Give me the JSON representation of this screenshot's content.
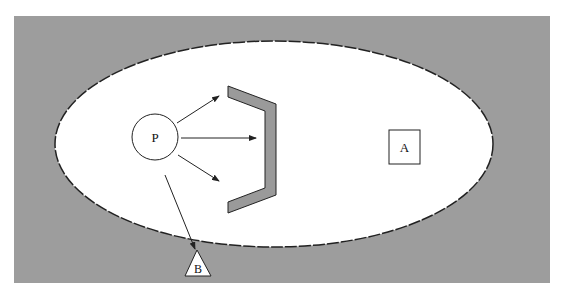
{
  "colors": {
    "page_background": "#ffffff",
    "outer_region": "#9d9d9d",
    "ellipse_fill": "#ffffff",
    "stroke": "#222222",
    "shield_fill": "#9a9a9a"
  },
  "outer_region": {
    "x": 14,
    "y": 16,
    "width": 536,
    "height": 267
  },
  "ellipse": {
    "cx": 274,
    "cy": 144,
    "rx": 219,
    "ry": 103,
    "border_style": "dashed"
  },
  "nodes": {
    "p": {
      "label": "P",
      "shape": "circle",
      "cx": 155,
      "cy": 137,
      "r": 23
    },
    "a": {
      "label": "A",
      "shape": "square",
      "x": 389,
      "y": 130,
      "width": 31,
      "height": 34
    },
    "b": {
      "label": "B",
      "shape": "triangle",
      "points": "197,250 185,276 211,276",
      "label_x": 198,
      "label_y": 272
    }
  },
  "shield": {
    "shape": "bracket",
    "points": "228,86 276,104 276,195 228,213 228,202 265,188 265,111 228,97"
  },
  "arrows": [
    {
      "id": "p-to-shield-top",
      "x1": 177,
      "y1": 123,
      "x2": 219,
      "y2": 96
    },
    {
      "id": "p-to-shield-middle",
      "x1": 181,
      "y1": 138,
      "x2": 256,
      "y2": 138
    },
    {
      "id": "p-to-shield-bottom",
      "x1": 178,
      "y1": 155,
      "x2": 219,
      "y2": 181
    },
    {
      "id": "p-to-b",
      "x1": 165,
      "y1": 175,
      "x2": 195,
      "y2": 249
    }
  ]
}
